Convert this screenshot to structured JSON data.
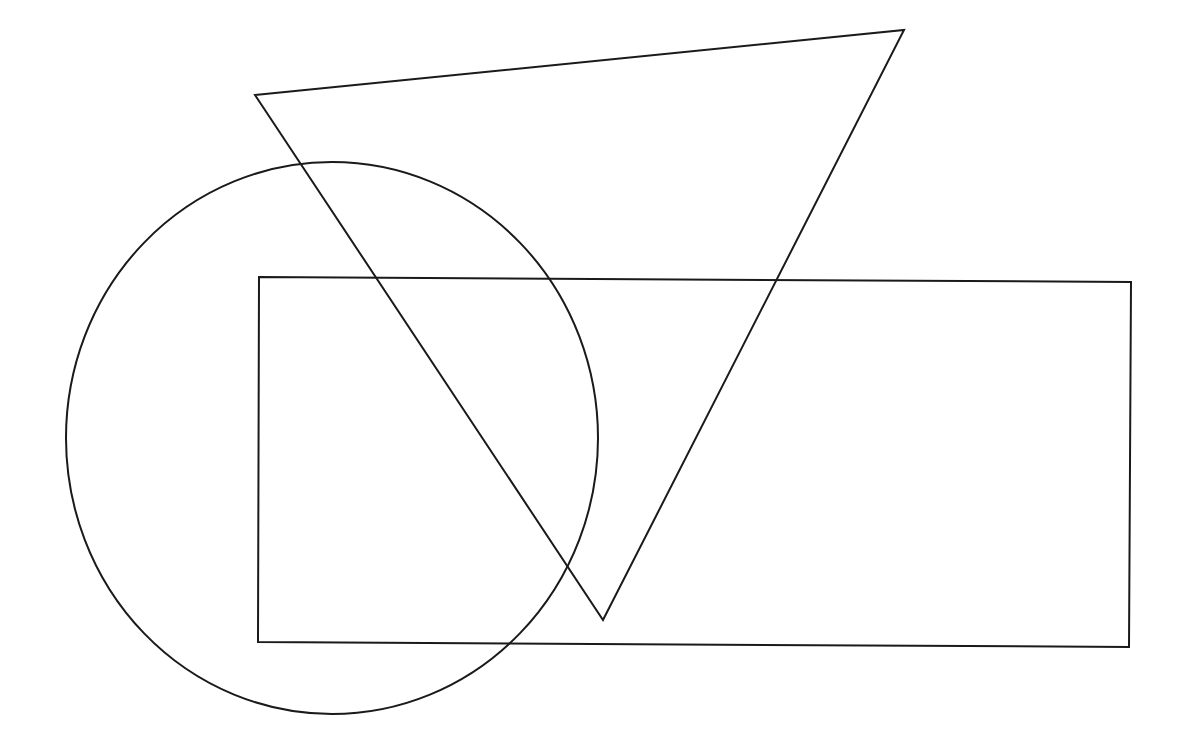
{
  "canvas": {
    "width": 1188,
    "height": 742,
    "background": "#ffffff"
  },
  "shapes": {
    "stroke_color": "#1a1a1a",
    "triangle": {
      "type": "triangle",
      "points": [
        [
          255,
          95
        ],
        [
          904,
          30
        ],
        [
          603,
          620
        ]
      ]
    },
    "ellipse": {
      "type": "ellipse",
      "cx": 332,
      "cy": 438,
      "rx": 266,
      "ry": 276
    },
    "rectangle": {
      "type": "quadrilateral",
      "points": [
        [
          259,
          277
        ],
        [
          1131,
          282
        ],
        [
          1129,
          647
        ],
        [
          258,
          642
        ]
      ]
    }
  }
}
